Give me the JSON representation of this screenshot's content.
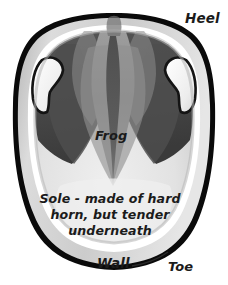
{
  "figure": {
    "background_color": "#ffffff",
    "labels": {
      "heel": "Heel",
      "frog": "Frog",
      "wall": "Wall",
      "toe": "Toe",
      "sole_line1": "Sole - made of hard",
      "sole_line2": "horn, but tender",
      "sole_line3": "underneath"
    },
    "colors": {
      "outline": "#000000",
      "wall_band": "#c9c9c9",
      "white_line": "#ffffff",
      "sole_light": "#e3e3e3",
      "sole_shade": "#cfcfcf",
      "frog_mid": "#8f8f8f",
      "bar_dark": "#565656",
      "heel_dark": "#3f3f3f",
      "bulb_light": "#f2f2f2",
      "label_text": "#1b1b1b"
    }
  }
}
